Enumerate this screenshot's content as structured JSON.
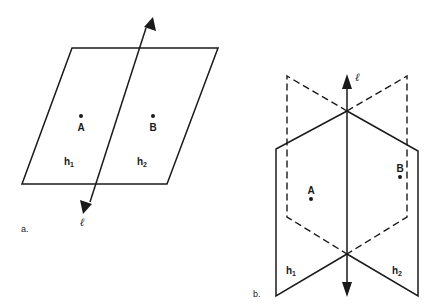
{
  "figure": {
    "diagram_a": {
      "caption": "a.",
      "line_label": "ℓ",
      "points": [
        {
          "label": "A"
        },
        {
          "label": "B"
        }
      ],
      "half_planes": [
        {
          "base": "h",
          "sub": "1"
        },
        {
          "base": "h",
          "sub": "2"
        }
      ]
    },
    "diagram_b": {
      "caption": "b.",
      "line_label": "ℓ",
      "points": [
        {
          "label": "A"
        },
        {
          "label": "B"
        }
      ],
      "half_planes": [
        {
          "base": "h",
          "sub": "1"
        },
        {
          "base": "h",
          "sub": "2"
        }
      ]
    },
    "colors": {
      "stroke": "#1a1a1a",
      "background": "#ffffff"
    }
  }
}
